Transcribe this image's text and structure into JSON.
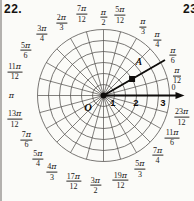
{
  "page": {
    "problem_number_left": "22.",
    "problem_number_right": "23"
  },
  "colors": {
    "background": "#fbfbf8",
    "grid_line": "#4e4b48",
    "bold_line": "#0f0d0b",
    "label_text": "#1c1a18"
  },
  "chart_data": {
    "type": "polar_grid",
    "origin_label": "O",
    "num_rays": 24,
    "ray_step": "π/12",
    "circle_radii": [
      0.5,
      1,
      1.5,
      2,
      2.5,
      3
    ],
    "axis_numbers": [
      "1",
      "2",
      "3"
    ],
    "polar_axis_angle_degrees": 0,
    "bold_ray_angle_degrees": 30,
    "point": {
      "label": "A",
      "r": 1.5,
      "theta": "π/6",
      "theta_degrees": 30
    },
    "angle_labels": [
      {
        "deg": 0,
        "num": "0",
        "den": ""
      },
      {
        "deg": 15,
        "num": "π",
        "den": "12"
      },
      {
        "deg": 30,
        "num": "π",
        "den": "6"
      },
      {
        "deg": 45,
        "num": "π",
        "den": "4"
      },
      {
        "deg": 60,
        "num": "π",
        "den": "3"
      },
      {
        "deg": 75,
        "num": "5π",
        "den": "12"
      },
      {
        "deg": 90,
        "num": "π",
        "den": "2"
      },
      {
        "deg": 105,
        "num": "7π",
        "den": "12"
      },
      {
        "deg": 120,
        "num": "2π",
        "den": "3"
      },
      {
        "deg": 135,
        "num": "3π",
        "den": "4"
      },
      {
        "deg": 150,
        "num": "5π",
        "den": "6"
      },
      {
        "deg": 165,
        "num": "11π",
        "den": "12"
      },
      {
        "deg": 180,
        "num": "π",
        "den": ""
      },
      {
        "deg": 195,
        "num": "13π",
        "den": "12"
      },
      {
        "deg": 210,
        "num": "7π",
        "den": "6"
      },
      {
        "deg": 225,
        "num": "5π",
        "den": "4"
      },
      {
        "deg": 240,
        "num": "4π",
        "den": "3"
      },
      {
        "deg": 255,
        "num": "17π",
        "den": "12"
      },
      {
        "deg": 270,
        "num": "3π",
        "den": "2"
      },
      {
        "deg": 285,
        "num": "19π",
        "den": "12"
      },
      {
        "deg": 300,
        "num": "5π",
        "den": "3"
      },
      {
        "deg": 315,
        "num": "7π",
        "den": "4"
      },
      {
        "deg": 330,
        "num": "11π",
        "den": "6"
      },
      {
        "deg": 345,
        "num": "23π",
        "den": "12"
      }
    ]
  }
}
